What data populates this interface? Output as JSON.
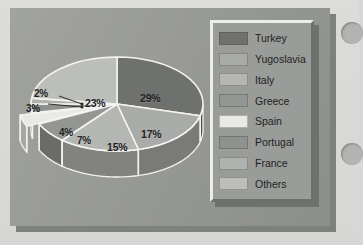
{
  "slide": {
    "background_color": "#979996",
    "page_color": "#d9dad8"
  },
  "decorations": {
    "hole_1_name": "binder-hole",
    "hole_2_name": "binder-hole",
    "hole_color": "#b3b4b2"
  },
  "legend": {
    "title": "",
    "position": "right",
    "items": [
      {
        "label": "Turkey",
        "color": "#6f716e"
      },
      {
        "label": "Yugoslavia",
        "color": "#a9aba8"
      },
      {
        "label": "Italy",
        "color": "#b4b6b3"
      },
      {
        "label": "Greece",
        "color": "#939693"
      },
      {
        "label": "Spain",
        "color": "#e8eae7"
      },
      {
        "label": "Portugal",
        "color": "#8e918e"
      },
      {
        "label": "France",
        "color": "#b0b2af"
      },
      {
        "label": "Others",
        "color": "#bcbeba"
      }
    ]
  },
  "chart_data": {
    "type": "pie",
    "title": "",
    "subtitle": "",
    "xlabel": "",
    "ylabel": "",
    "three_d": true,
    "exploded_slices": [
      "Spain"
    ],
    "start_angle_deg": 0,
    "direction": "clockwise",
    "legend_position": "right",
    "grid": false,
    "categories": [
      "Turkey",
      "Yugoslavia",
      "Italy",
      "Greece",
      "Spain",
      "Portugal",
      "France",
      "Others"
    ],
    "values": [
      29,
      17,
      15,
      7,
      4,
      3,
      2,
      23
    ],
    "value_unit": "%",
    "total": 100,
    "labels": [
      {
        "name": "Turkey",
        "text": "29%",
        "x": 130,
        "y": 84
      },
      {
        "name": "Yugoslavia",
        "text": "17%",
        "x": 131,
        "y": 120
      },
      {
        "name": "Italy",
        "text": "15%",
        "x": 97,
        "y": 133
      },
      {
        "name": "Greece",
        "text": "7%",
        "x": 67,
        "y": 127
      },
      {
        "name": "Spain",
        "text": "4%",
        "x": 49,
        "y": 119
      },
      {
        "name": "Portugal",
        "text": "3%",
        "x": 16,
        "y": 95
      },
      {
        "name": "France",
        "text": "2%",
        "x": 24,
        "y": 80
      },
      {
        "name": "Others",
        "text": "23%",
        "x": 75,
        "y": 89
      }
    ],
    "colors": {
      "Turkey": "#6f716e",
      "Yugoslavia": "#a9aba8",
      "Italy": "#b4b6b3",
      "Greece": "#939693",
      "Spain": "#e8eae7",
      "Portugal": "#8e918e",
      "France": "#b0b2af",
      "Others": "#bcbeba"
    }
  }
}
